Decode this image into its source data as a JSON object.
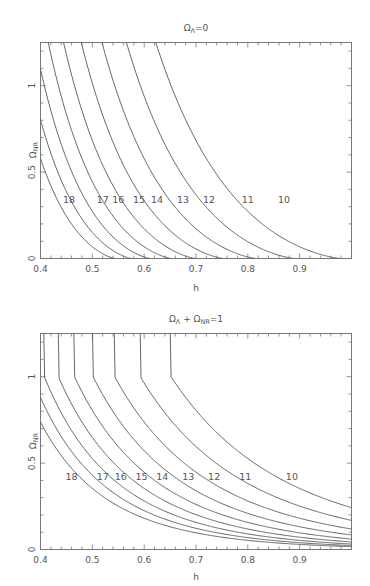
{
  "chart_data": [
    {
      "type": "line",
      "title": "Ω_Λ=0",
      "title_main": "Ω",
      "title_sub": "Λ",
      "title_rest": "=0",
      "xlabel": "h",
      "ylabel": "Ω_NR",
      "xlim": [
        0.4,
        1.0
      ],
      "ylim": [
        0,
        1.25
      ],
      "xticks": [
        "0.4",
        "0.5",
        "0.6",
        "0.7",
        "0.8",
        "0.9"
      ],
      "yticks": [
        "0",
        "0.5",
        "1"
      ],
      "grid": false,
      "description": "Contours of constant universe age t0 (Gyr) in the (h, Ω_NR) plane for an open universe with no cosmological constant",
      "series_labels": [
        "10",
        "11",
        "12",
        "13",
        "14",
        "15",
        "16",
        "17",
        "18"
      ],
      "series_ages_gyr": [
        10,
        11,
        12,
        13,
        14,
        15,
        16,
        17,
        18
      ],
      "label_y": 0.34,
      "label_x": [
        0.87,
        0.8,
        0.725,
        0.675,
        0.625,
        0.59,
        0.55,
        0.52,
        0.455
      ],
      "zero_crossings_h": [
        0.98,
        0.89,
        0.815,
        0.75,
        0.7,
        0.65,
        0.61,
        0.575,
        0.545
      ]
    },
    {
      "type": "line",
      "title": "Ω_Λ + Ω_NR=1",
      "title_main": "Ω",
      "title_sub": "Λ",
      "title_mid": " + Ω",
      "title_sub2": "NR",
      "title_rest": "=1",
      "xlabel": "h",
      "ylabel": "Ω_NR",
      "xlim": [
        0.4,
        1.0
      ],
      "ylim": [
        0,
        1.25
      ],
      "xticks": [
        "0.4",
        "0.5",
        "0.6",
        "0.7",
        "0.8",
        "0.9"
      ],
      "yticks": [
        "0",
        "0.5",
        "1"
      ],
      "grid": false,
      "description": "Contours of constant universe age t0 (Gyr) in the (h, Ω_NR) plane for a flat universe with cosmological constant",
      "series_labels": [
        "10",
        "11",
        "12",
        "13",
        "14",
        "15",
        "16",
        "17",
        "18"
      ],
      "series_ages_gyr": [
        10,
        11,
        12,
        13,
        14,
        15,
        16,
        17,
        18
      ],
      "label_y": 0.42,
      "label_x": [
        0.885,
        0.795,
        0.735,
        0.685,
        0.635,
        0.595,
        0.555,
        0.52,
        0.46
      ],
      "values_at_h1": [
        0.26,
        0.18,
        0.13,
        0.1,
        0.08,
        0.06,
        0.05,
        0.04,
        0.03
      ]
    }
  ],
  "axes": {
    "ylabel_main": "Ω",
    "ylabel_sub": "NR",
    "xlabel": "h"
  }
}
